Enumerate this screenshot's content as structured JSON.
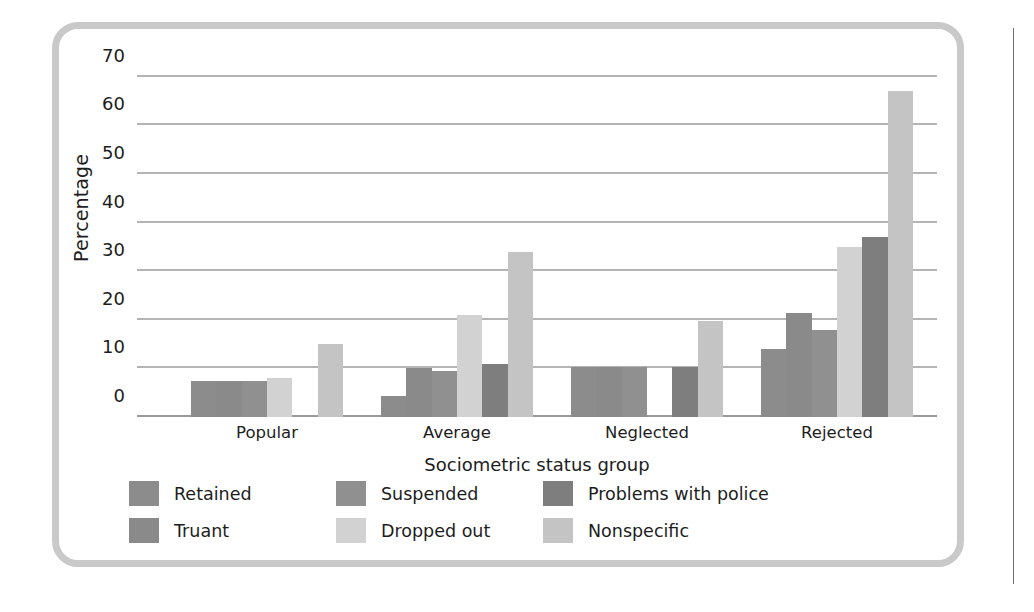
{
  "figure": {
    "frame_color": "#c9c9c9",
    "background": "#ffffff"
  },
  "chart_data": {
    "type": "bar",
    "title": "",
    "xlabel": "Sociometric status group",
    "ylabel": "Percentage",
    "categories": [
      "Popular",
      "Average",
      "Neglected",
      "Rejected"
    ],
    "ylim": [
      0,
      72
    ],
    "yticks": [
      0,
      10,
      20,
      30,
      40,
      50,
      60,
      70
    ],
    "ytick_labels": [
      "0",
      "10",
      "20",
      "30",
      "40",
      "50",
      "60",
      "70"
    ],
    "grid": true,
    "grid_axis": "y",
    "legend_position": "below-axes",
    "series": [
      {
        "name": "Retained",
        "color": "#8c8c8c",
        "values": [
          7.5,
          4.3,
          10.3,
          14.0
        ]
      },
      {
        "name": "Truant",
        "color": "#8a8a8a",
        "values": [
          7.5,
          10.0,
          10.3,
          21.5
        ]
      },
      {
        "name": "Suspended",
        "color": "#909090",
        "values": [
          7.5,
          9.5,
          10.3,
          18.0
        ]
      },
      {
        "name": "Dropped out",
        "color": "#d2d2d2",
        "values": [
          8.0,
          21.0,
          0.0,
          35.0
        ]
      },
      {
        "name": "Problems with police",
        "color": "#7e7e7e",
        "values": [
          0.0,
          11.0,
          10.3,
          37.0
        ]
      },
      {
        "name": "Nonspecific",
        "color": "#c4c4c4",
        "values": [
          15.0,
          34.0,
          19.7,
          67.0
        ]
      }
    ]
  },
  "legend": {
    "rows": [
      [
        {
          "label": "Retained",
          "color": "#8c8c8c"
        },
        {
          "label": "Suspended",
          "color": "#909090"
        },
        {
          "label": "Problems with police",
          "color": "#7e7e7e"
        }
      ],
      [
        {
          "label": "Truant",
          "color": "#8a8a8a"
        },
        {
          "label": "Dropped out",
          "color": "#d2d2d2"
        },
        {
          "label": "Nonspecific",
          "color": "#c4c4c4"
        }
      ]
    ]
  }
}
